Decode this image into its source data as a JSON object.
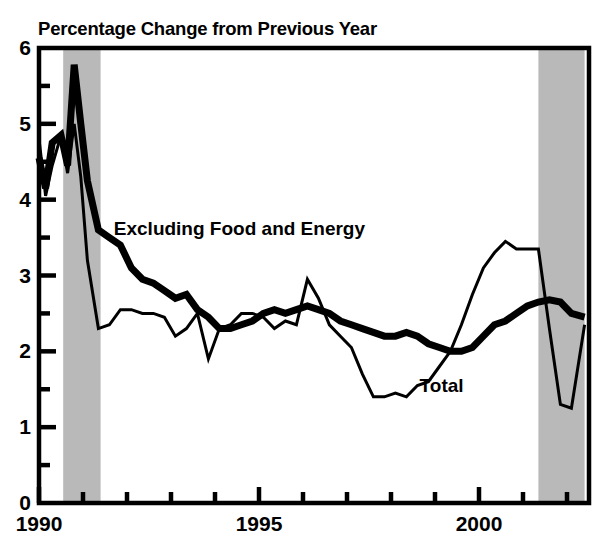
{
  "chart_data": {
    "type": "line",
    "title": "Percentage Change from Previous Year",
    "xlabel": "",
    "ylabel": "",
    "xlim": [
      1990.0,
      2002.5
    ],
    "ylim": [
      0,
      6
    ],
    "grid": false,
    "legend_position": "inline-annotations",
    "y_ticks_major": [
      "0",
      "1",
      "2",
      "3",
      "4",
      "5",
      "6"
    ],
    "y_ticks_major_values": [
      0,
      1,
      2,
      3,
      4,
      5,
      6
    ],
    "y_ticks_minor_values": [
      0.5,
      1.5,
      2.5,
      3.5,
      4.5,
      5.5
    ],
    "x_ticks_major": [
      "1990",
      "1995",
      "2000"
    ],
    "x_ticks_major_values": [
      1990,
      1995,
      2000
    ],
    "x_ticks_minor_values": [
      1991,
      1992,
      1993,
      1994,
      1996,
      1997,
      1998,
      1999,
      2001,
      2002
    ],
    "shaded_regions": [
      {
        "label": "recession",
        "x_start": 1990.55,
        "x_end": 1991.4,
        "color": "#b9b9b9"
      },
      {
        "label": "recession",
        "x_start": 2001.35,
        "x_end": 2002.4,
        "color": "#b9b9b9"
      }
    ],
    "series": [
      {
        "name": "Excluding Food and Energy",
        "style": "thick",
        "line_width": 7,
        "color": "#000000",
        "annotation": "Excluding Food and Energy",
        "x": [
          1990.0,
          1990.15,
          1990.3,
          1990.5,
          1990.65,
          1990.8,
          1990.95,
          1991.1,
          1991.35,
          1991.6,
          1991.85,
          1992.1,
          1992.35,
          1992.6,
          1992.85,
          1993.1,
          1993.35,
          1993.6,
          1993.85,
          1994.1,
          1994.35,
          1994.6,
          1994.85,
          1995.1,
          1995.35,
          1995.6,
          1995.85,
          1996.1,
          1996.35,
          1996.6,
          1996.85,
          1997.1,
          1997.35,
          1997.6,
          1997.85,
          1998.1,
          1998.35,
          1998.6,
          1998.85,
          1999.1,
          1999.35,
          1999.6,
          1999.85,
          2000.1,
          2000.35,
          2000.6,
          2000.85,
          2001.1,
          2001.35,
          2001.6,
          2001.85,
          2002.1,
          2002.4
        ],
        "y": [
          4.55,
          4.15,
          4.75,
          4.85,
          4.45,
          5.78,
          5.0,
          4.25,
          3.6,
          3.5,
          3.4,
          3.1,
          2.95,
          2.9,
          2.8,
          2.7,
          2.75,
          2.55,
          2.45,
          2.3,
          2.3,
          2.35,
          2.4,
          2.5,
          2.55,
          2.5,
          2.55,
          2.6,
          2.55,
          2.5,
          2.4,
          2.35,
          2.3,
          2.25,
          2.2,
          2.2,
          2.25,
          2.2,
          2.1,
          2.05,
          2.0,
          2.0,
          2.05,
          2.2,
          2.35,
          2.4,
          2.5,
          2.6,
          2.65,
          2.68,
          2.65,
          2.5,
          2.45
        ]
      },
      {
        "name": "Total",
        "style": "thin",
        "line_width": 3,
        "color": "#000000",
        "annotation": "Total",
        "x": [
          1990.0,
          1990.15,
          1990.3,
          1990.5,
          1990.65,
          1990.8,
          1990.95,
          1991.1,
          1991.35,
          1991.6,
          1991.85,
          1992.1,
          1992.35,
          1992.6,
          1992.85,
          1993.1,
          1993.35,
          1993.6,
          1993.85,
          1994.1,
          1994.35,
          1994.6,
          1994.85,
          1995.1,
          1995.35,
          1995.6,
          1995.85,
          1996.1,
          1996.35,
          1996.6,
          1996.85,
          1997.1,
          1997.35,
          1997.6,
          1997.85,
          1998.1,
          1998.35,
          1998.6,
          1998.85,
          1999.1,
          1999.35,
          1999.6,
          1999.85,
          2000.1,
          2000.35,
          2000.6,
          2000.85,
          2001.1,
          2001.35,
          2001.6,
          2001.85,
          2002.1,
          2002.4
        ],
        "y": [
          4.8,
          4.05,
          4.45,
          4.85,
          4.35,
          5.0,
          4.3,
          3.2,
          2.3,
          2.35,
          2.55,
          2.55,
          2.5,
          2.5,
          2.45,
          2.2,
          2.3,
          2.5,
          1.9,
          2.3,
          2.35,
          2.5,
          2.5,
          2.45,
          2.3,
          2.4,
          2.35,
          2.95,
          2.7,
          2.35,
          2.2,
          2.05,
          1.7,
          1.4,
          1.4,
          1.45,
          1.4,
          1.55,
          1.6,
          1.8,
          2.0,
          2.35,
          2.75,
          3.1,
          3.3,
          3.45,
          3.35,
          3.35,
          3.35,
          2.3,
          1.3,
          1.25,
          2.35
        ]
      }
    ]
  },
  "axes": {
    "title": "Percentage Change from Previous Year",
    "y_labels": [
      "6",
      "5",
      "4",
      "3",
      "2",
      "1",
      "0"
    ],
    "x_labels": [
      "1990",
      "1995",
      "2000"
    ]
  },
  "annotations": {
    "core": "Excluding Food and Energy",
    "total": "Total"
  },
  "colors": {
    "line": "#000000",
    "shading": "#b9b9b9",
    "background": "#ffffff",
    "frame": "#000000"
  }
}
